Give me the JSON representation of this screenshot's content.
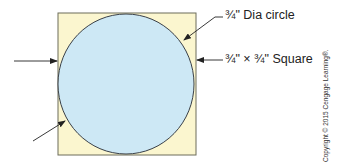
{
  "diagram": {
    "labels": {
      "circle": "¾\" Dia circle",
      "square": "¾\" × ¾\" Square"
    },
    "copyright": "Copyright © 2015 Cengage Learning®.",
    "colors": {
      "square_fill": "#fbf6cf",
      "square_stroke": "#6d6d5a",
      "circle_fill": "#cde8f5",
      "circle_stroke": "#3a4048",
      "arrow": "#222222"
    }
  }
}
